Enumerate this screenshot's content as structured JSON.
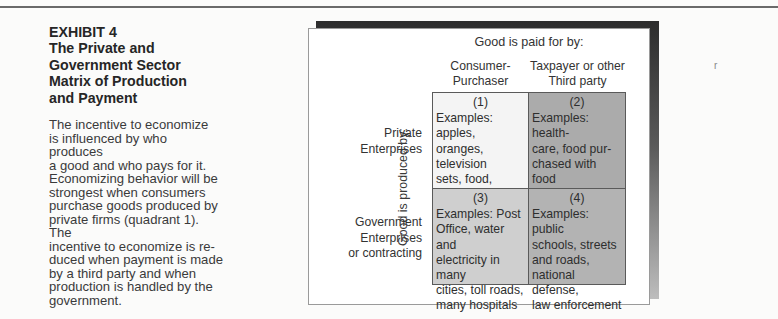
{
  "exhibit": {
    "number_label": "EXHIBIT 4",
    "title_lines": [
      "The Private and",
      "Government Sector",
      "Matrix of Production",
      "and Payment"
    ],
    "description_lines": [
      "The incentive to economize",
      "is influenced by who produces",
      "a good and who pays for it.",
      "Economizing behavior will be",
      "strongest when consumers",
      "purchase goods produced by",
      "private firms (quadrant 1). The",
      "incentive to economize is re-",
      "duced when payment is made",
      "by a third party and when",
      "production is handled by the",
      "government."
    ]
  },
  "matrix": {
    "column_axis_label": "Good is paid for by:",
    "row_axis_label": "Good is produced by:",
    "columns": [
      {
        "lines": [
          "Consumer-",
          "Purchaser"
        ]
      },
      {
        "lines": [
          "Taxpayer or other",
          "Third party"
        ]
      }
    ],
    "rows": [
      {
        "lines": [
          "Private",
          "Enterprises"
        ]
      },
      {
        "lines": [
          "Government",
          "Enterprises",
          "or contracting"
        ]
      }
    ],
    "quadrants": [
      {
        "number": "(1)",
        "lines": [
          "Examples: apples,",
          "oranges, television",
          "sets, food, housing,",
          "most other goods"
        ],
        "color": "#f4f4f4"
      },
      {
        "number": "(2)",
        "lines": [
          "Examples: health-",
          "care, food pur-",
          "chased with food",
          "stamps"
        ],
        "color": "#ababab"
      },
      {
        "number": "(3)",
        "lines": [
          "Examples: Post",
          "Office, water and",
          "electricity in many",
          "cities, toll roads,",
          "many hospitals"
        ],
        "color": "#cfcfcf"
      },
      {
        "number": "(4)",
        "lines": [
          "Examples: public",
          "schools, streets",
          "and roads,",
          "national defense,",
          "law enforcement"
        ],
        "color": "#b3b3b3"
      }
    ]
  },
  "stray_mark": "r"
}
